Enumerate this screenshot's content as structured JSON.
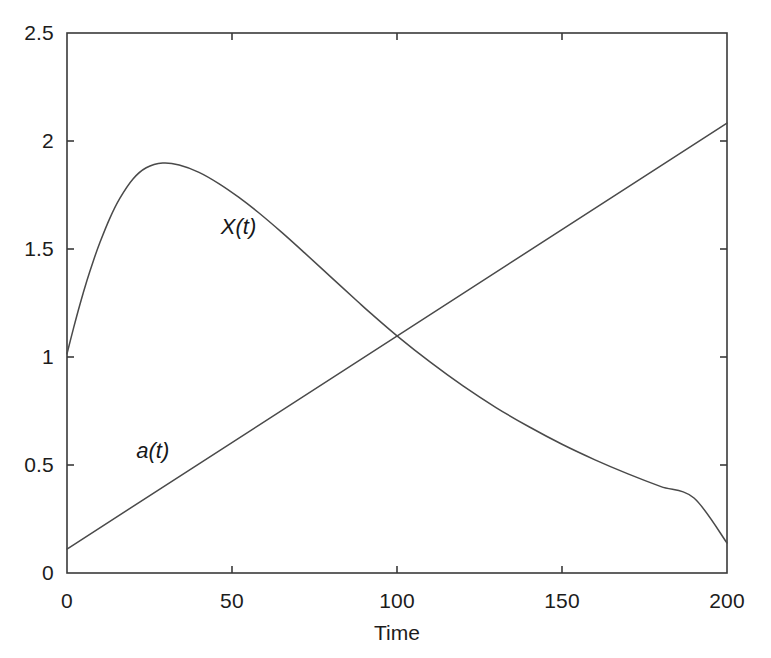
{
  "figure": {
    "background_color": "#ffffff",
    "axes_color": "#3a3a3a",
    "curve_color": "#4a4a4a"
  },
  "chart_data": {
    "type": "line",
    "title": "",
    "subtitle": "",
    "xlabel": "Time",
    "ylabel": "",
    "xlim": [
      0,
      200
    ],
    "ylim": [
      0,
      2.5
    ],
    "xticks": [
      0,
      50,
      100,
      150,
      200
    ],
    "xtick_labels": [
      "0",
      "50",
      "100",
      "150",
      "200"
    ],
    "yticks": [
      0,
      0.5,
      1,
      1.5,
      2,
      2.5
    ],
    "ytick_labels": [
      "0",
      "0.5",
      "1",
      "1.5",
      "2",
      "2.5"
    ],
    "grid": false,
    "legend": "inline-annotations",
    "annotations": [
      {
        "text": "X(t)",
        "x": 52,
        "y": 1.6
      },
      {
        "text": "a(t)",
        "x": 26,
        "y": 0.565
      }
    ],
    "series": [
      {
        "name": "X(t)",
        "style": "solid",
        "x": [
          0,
          2,
          4,
          6,
          8,
          10,
          13,
          16,
          20,
          24,
          29,
          34,
          40,
          46,
          52,
          58,
          65,
          72,
          80,
          88,
          92,
          100,
          110,
          120,
          130,
          140,
          150,
          160,
          170,
          180,
          190,
          200
        ],
        "y": [
          1.015,
          1.135,
          1.248,
          1.352,
          1.446,
          1.531,
          1.643,
          1.734,
          1.824,
          1.876,
          1.898,
          1.889,
          1.855,
          1.803,
          1.74,
          1.669,
          1.578,
          1.482,
          1.37,
          1.258,
          1.203,
          1.098,
          0.977,
          0.866,
          0.766,
          0.677,
          0.596,
          0.524,
          0.459,
          0.4,
          0.347,
          0.139
        ],
        "start_value": 1.015,
        "peak": {
          "x": 29,
          "y": 1.898
        },
        "end_value": 0.139
      },
      {
        "name": "a(t)",
        "style": "solid",
        "x": [
          0,
          200
        ],
        "y": [
          0.111,
          2.083
        ],
        "start_value": 0.111,
        "end_value": 2.083
      }
    ],
    "intersection": {
      "x": 91.5,
      "y": 1.02
    }
  }
}
